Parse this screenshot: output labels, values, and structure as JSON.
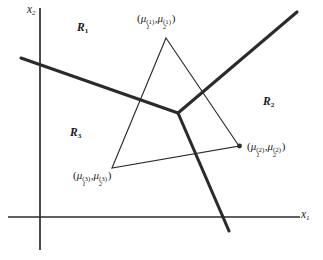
{
  "figure": {
    "type": "diagram",
    "background_color": "#ffffff",
    "ink_color": "#2b2b2b"
  },
  "axes": {
    "x_axis": {
      "label_text": "x",
      "label_sub": "1",
      "start_px": [
        8,
        217
      ],
      "end_px": [
        300,
        217
      ],
      "stroke_width": 1.6
    },
    "y_axis": {
      "label_text": "x",
      "label_sub": "2",
      "start_px": [
        40,
        250
      ],
      "end_px": [
        40,
        8
      ],
      "stroke_width": 1.6
    }
  },
  "regions": [
    {
      "id": "R1",
      "letter": "R",
      "sub": "1",
      "x": 77,
      "y": 22
    },
    {
      "id": "R2",
      "letter": "R",
      "sub": "2",
      "x": 263,
      "y": 96
    },
    {
      "id": "R3",
      "letter": "R",
      "sub": "3",
      "x": 70,
      "y": 127
    }
  ],
  "mean_points": [
    {
      "id": "mu1",
      "open_paren": "(",
      "mu": "μ",
      "sub1": "1",
      "sup1": "(1)",
      "comma": ",",
      "sub2": "2",
      "sup2": "(1)",
      "close_paren": ")",
      "vertex_px": [
        166,
        38
      ],
      "label_px": [
        137,
        13
      ],
      "marker": "none"
    },
    {
      "id": "mu2",
      "open_paren": "(",
      "mu": "μ",
      "sub1": "1",
      "sup1": "(2)",
      "comma": ",",
      "sub2": "2",
      "sup2": "(2)",
      "close_paren": ")",
      "vertex_px": [
        239,
        146
      ],
      "label_px": [
        247,
        141
      ],
      "marker": "dot"
    },
    {
      "id": "mu3",
      "open_paren": "(",
      "mu": "μ",
      "sub1": "1",
      "sup1": "(3)",
      "comma": ",",
      "sub2": "2",
      "sup2": "(3)",
      "close_paren": ")",
      "vertex_px": [
        112,
        168
      ],
      "label_px": [
        73,
        170
      ],
      "marker": "none"
    }
  ],
  "triangle": {
    "name": "mean-vector-triangle",
    "stroke_width": 1.1,
    "vertices_px": [
      [
        166,
        38
      ],
      [
        239,
        146
      ],
      [
        112,
        168
      ]
    ]
  },
  "boundaries": {
    "stroke_width": 3.0,
    "junction_px": [
      178,
      113
    ],
    "segments": [
      {
        "id": "boundary-r1-r3",
        "from_px": [
          178,
          113
        ],
        "to_px": [
          21,
          58
        ]
      },
      {
        "id": "boundary-r1-r2",
        "from_px": [
          178,
          113
        ],
        "to_px": [
          297,
          12
        ]
      },
      {
        "id": "boundary-r2-r3",
        "from_px": [
          178,
          113
        ],
        "to_px": [
          229,
          231
        ]
      }
    ]
  }
}
